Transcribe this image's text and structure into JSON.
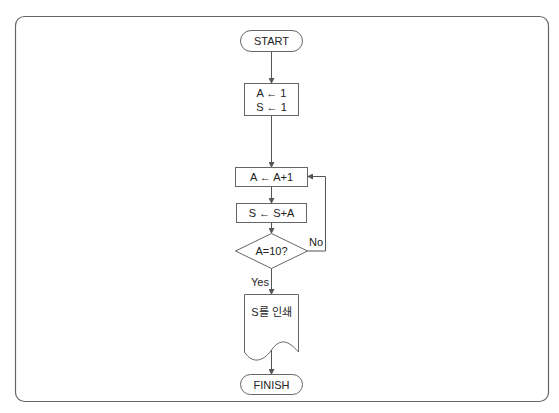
{
  "flowchart": {
    "start": "START",
    "init_line1": "A ← 1",
    "init_line2": "S ← 1",
    "increment": "A ← A+1",
    "accumulate": "S ← S+A",
    "decision": "A=10?",
    "yes_label": "Yes",
    "no_label": "No",
    "output": "S를 인쇄",
    "finish": "FINISH"
  },
  "colors": {
    "line": "#555555",
    "frame": "#666666",
    "text": "#222222"
  }
}
